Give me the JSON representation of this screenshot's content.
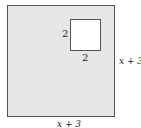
{
  "diagram": {
    "outer_square": {
      "fill": "#e6e6e6",
      "side_right_label": "x + 3",
      "side_bottom_label": "x + 3"
    },
    "inner_square": {
      "fill": "#ffffff",
      "side_left_label": "2",
      "side_bottom_label": "2"
    }
  }
}
